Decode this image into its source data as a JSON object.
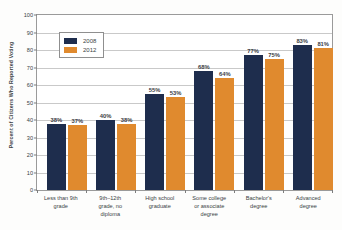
{
  "chart_data": {
    "type": "bar",
    "title": "Voting, 2008 and 2012",
    "xlabel": "",
    "ylabel": "Percent of Citizens Who Reported Voting",
    "ylim": [
      0,
      100
    ],
    "ytick_labels": [
      "100",
      "90",
      "80",
      "70",
      "60",
      "50",
      "40",
      "30",
      "20",
      "10",
      "0"
    ],
    "ytick_values": [
      100,
      90,
      80,
      70,
      60,
      50,
      40,
      30,
      20,
      10,
      0
    ],
    "grid": true,
    "legend_position": "upper-left-inside",
    "categories": [
      "Less than 9th grade",
      "9th–12th grade, no diploma",
      "High school graduate",
      "Some college or associate degree",
      "Bachelor's degree",
      "Advanced degree"
    ],
    "category_lines": [
      [
        "Less than 9th",
        "grade"
      ],
      [
        "9th–12th",
        "grade, no",
        "diploma"
      ],
      [
        "High school",
        "graduate"
      ],
      [
        "Some college",
        "or associate",
        "degree"
      ],
      [
        "Bachelor's",
        "degree"
      ],
      [
        "Advanced",
        "degree"
      ]
    ],
    "series": [
      {
        "name": "2008",
        "color": "#1e2d4d",
        "values": [
          38,
          40,
          55,
          68,
          77,
          83
        ],
        "labels": [
          "38%",
          "40%",
          "55%",
          "68%",
          "77%",
          "83%"
        ]
      },
      {
        "name": "2012",
        "color": "#e08a2e",
        "values": [
          37,
          38,
          53,
          64,
          75,
          81
        ],
        "labels": [
          "37%",
          "38%",
          "53%",
          "64%",
          "75%",
          "81%"
        ]
      }
    ]
  },
  "legend": {
    "entries": [
      {
        "label": "2008",
        "color": "#1e2d4d"
      },
      {
        "label": "2012",
        "color": "#e08a2e"
      }
    ]
  }
}
